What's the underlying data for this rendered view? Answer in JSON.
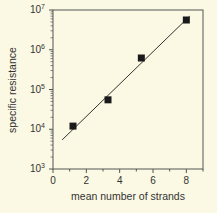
{
  "chart_data": {
    "type": "scatter",
    "title": "",
    "xlabel": "mean number of strands",
    "ylabel": "specific resistance",
    "xlim": [
      0,
      9
    ],
    "ylim": [
      1000,
      10000000
    ],
    "yscale": "log",
    "x_ticks": [
      0,
      2,
      4,
      6,
      8
    ],
    "x_tick_labels": [
      "0",
      "2",
      "4",
      "6",
      "8"
    ],
    "y_ticks": [
      1000,
      10000,
      100000,
      1000000,
      10000000
    ],
    "y_tick_labels": [
      {
        "base": "10",
        "exp": "3"
      },
      {
        "base": "10",
        "exp": "4"
      },
      {
        "base": "10",
        "exp": "5"
      },
      {
        "base": "10",
        "exp": "6"
      },
      {
        "base": "10",
        "exp": "7"
      }
    ],
    "grid": false,
    "legend": null,
    "series": [
      {
        "name": "measured",
        "marker": "square",
        "color": "#1a1a1a",
        "x": [
          1.2,
          3.3,
          5.3,
          8.0
        ],
        "y": [
          12000,
          55000,
          620000,
          5600000
        ]
      },
      {
        "name": "fit",
        "type": "line",
        "color": "#333333",
        "x": [
          0.55,
          8.2
        ],
        "y": [
          5400,
          7000000
        ]
      }
    ]
  }
}
